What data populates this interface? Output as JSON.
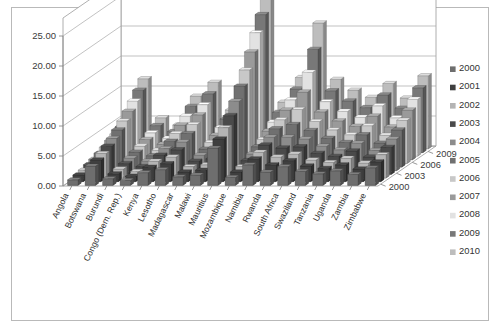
{
  "chart_data": {
    "type": "bar",
    "subtype": "3d-grouped-bar",
    "title": "",
    "xlabel": "",
    "ylabel": "",
    "zlabel": "",
    "ylim": [
      0,
      25
    ],
    "ytick_labels": [
      "0.00",
      "5.00",
      "10.00",
      "15.00",
      "20.00",
      "25.00"
    ],
    "ytick_values": [
      0,
      5,
      10,
      15,
      20,
      25
    ],
    "grid": true,
    "legend_position": "right",
    "categories": [
      "Angola",
      "Botswana",
      "Burundi",
      "Congo (Dem. Rep.)",
      "Kenya",
      "Lesotho",
      "Madagascar",
      "Malawi",
      "Mauritius",
      "Mozambique",
      "Namibia",
      "Rwanda",
      "South Africa",
      "Swaziland",
      "Tanzania",
      "Uganda",
      "Zambia",
      "Zimbabwe"
    ],
    "depth_axis_ticks": [
      "2000",
      "2003",
      "2006",
      "2009"
    ],
    "series": [
      {
        "name": "2000",
        "color": "#6e6e6e",
        "values": [
          0.9,
          3.2,
          1.1,
          0.8,
          2.1,
          2.6,
          1.4,
          1.7,
          6.2,
          1.3,
          3.4,
          2.2,
          3.1,
          2.3,
          1.9,
          2.4,
          1.8,
          2.9
        ]
      },
      {
        "name": "2001",
        "color": "#3f3f3f",
        "values": [
          1.1,
          3.6,
          1.3,
          0.9,
          2.4,
          3.0,
          1.6,
          1.9,
          7.1,
          1.6,
          3.8,
          2.8,
          3.5,
          2.6,
          2.2,
          2.8,
          2.1,
          3.3
        ]
      },
      {
        "name": "2002",
        "color": "#b4b4b4",
        "values": [
          1.3,
          4.1,
          1.5,
          1.1,
          2.8,
          3.5,
          1.9,
          2.2,
          8.4,
          1.9,
          4.3,
          3.5,
          4.0,
          3.0,
          2.6,
          3.3,
          2.5,
          3.9
        ]
      },
      {
        "name": "2003",
        "color": "#4a4a4a",
        "values": [
          1.6,
          4.7,
          1.8,
          1.3,
          3.2,
          4.1,
          2.2,
          2.6,
          9.8,
          2.3,
          4.9,
          4.4,
          4.6,
          3.5,
          3.0,
          3.9,
          2.9,
          4.5
        ]
      },
      {
        "name": "2004",
        "color": "#8c8c8c",
        "values": [
          1.9,
          5.4,
          2.1,
          1.6,
          3.7,
          4.8,
          2.6,
          3.0,
          11.6,
          2.8,
          5.6,
          5.6,
          5.3,
          4.1,
          3.5,
          4.6,
          3.4,
          5.3
        ]
      },
      {
        "name": "2005",
        "color": "#707070",
        "values": [
          2.3,
          6.2,
          2.5,
          1.9,
          4.3,
          5.6,
          3.0,
          3.5,
          13.5,
          3.4,
          6.4,
          7.1,
          6.1,
          4.8,
          4.1,
          5.4,
          4.0,
          6.2
        ]
      },
      {
        "name": "2006",
        "color": "#c8c8c8",
        "values": [
          2.7,
          7.1,
          2.9,
          2.2,
          5.0,
          6.5,
          3.5,
          4.1,
          15.6,
          4.0,
          7.3,
          9.0,
          7.0,
          5.6,
          4.8,
          6.3,
          4.7,
          7.2
        ]
      },
      {
        "name": "2007",
        "color": "#9a9a9a",
        "values": [
          3.2,
          8.1,
          3.4,
          2.6,
          5.8,
          7.5,
          4.1,
          4.8,
          18.0,
          4.8,
          8.3,
          11.3,
          8.0,
          6.5,
          5.6,
          7.3,
          5.5,
          8.3
        ]
      },
      {
        "name": "2008",
        "color": "#e2e2e2",
        "values": [
          3.7,
          9.2,
          3.9,
          3.0,
          6.7,
          8.6,
          4.8,
          5.6,
          20.6,
          5.7,
          9.4,
          14.0,
          9.1,
          7.5,
          6.5,
          8.4,
          6.4,
          9.5
        ]
      },
      {
        "name": "2009",
        "color": "#787878",
        "values": [
          4.3,
          10.4,
          4.5,
          3.5,
          7.7,
          9.8,
          5.6,
          6.5,
          23.0,
          6.7,
          10.6,
          17.2,
          10.3,
          8.6,
          7.5,
          9.6,
          7.4,
          10.8
        ]
      },
      {
        "name": "2010",
        "color": "#bdbdbd",
        "values": [
          5.0,
          11.7,
          5.2,
          4.0,
          8.8,
          11.1,
          6.5,
          7.5,
          25.2,
          7.8,
          11.9,
          21.0,
          11.6,
          9.8,
          8.6,
          10.9,
          8.5,
          12.2
        ]
      }
    ]
  },
  "legend": {
    "items": [
      {
        "label": "2000"
      },
      {
        "label": "2001"
      },
      {
        "label": "2002"
      },
      {
        "label": "2003"
      },
      {
        "label": "2004"
      },
      {
        "label": "2005"
      },
      {
        "label": "2006"
      },
      {
        "label": "2007"
      },
      {
        "label": "2008"
      },
      {
        "label": "2009"
      },
      {
        "label": "2010"
      }
    ]
  },
  "colors": {
    "frame_border": "#b9b9b9",
    "grid": "#a8a8a8",
    "wall": "#9a9a9a",
    "text": "#333333",
    "background": "#ffffff"
  }
}
